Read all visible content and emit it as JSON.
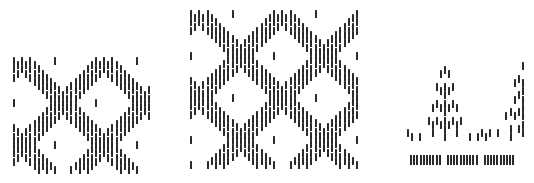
{
  "figure": {
    "ink_color": "#2b2b2b",
    "background": "#ffffff"
  },
  "panels": [
    {
      "name": "pattern-panel-left",
      "x": 13,
      "y": 57,
      "width": 138,
      "height": 118,
      "col_step": 4.1,
      "dash_h": 8,
      "row_step": 4.2,
      "motif": "diamond-lattice",
      "period": 20,
      "rows": 27
    },
    {
      "name": "pattern-panel-center",
      "x": 190,
      "y": 10,
      "width": 170,
      "height": 162,
      "col_step": 4.15,
      "dash_h": 8,
      "row_step": 4.2,
      "motif": "diamond-lattice",
      "period": 20,
      "rows": 37
    },
    {
      "name": "pattern-panel-right",
      "x": 407,
      "y": 62,
      "width": 118,
      "height": 82,
      "col_step": 4.1,
      "dash_h": 8,
      "row_step": 4.2,
      "motif": "tree-zigzag",
      "period": 19,
      "rows": 18,
      "fringe": {
        "y": 155,
        "height": 10,
        "groups": 3,
        "bars_per_group": 10,
        "bar_step": 3.2,
        "group_gap": 6
      }
    }
  ]
}
